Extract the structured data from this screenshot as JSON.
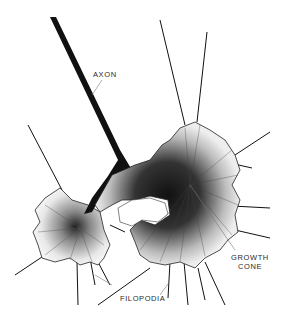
{
  "figure": {
    "labels": {
      "axon": "AXON",
      "growth_cone_line1": "GROWTH",
      "growth_cone_line2": "CONE",
      "filopodia": "FILOPODIA"
    },
    "colors": {
      "ink": "#111111",
      "stipple": "#3a3a3a",
      "fill": "#f2f2f2",
      "background": "#ffffff",
      "leader": "#777777"
    }
  }
}
